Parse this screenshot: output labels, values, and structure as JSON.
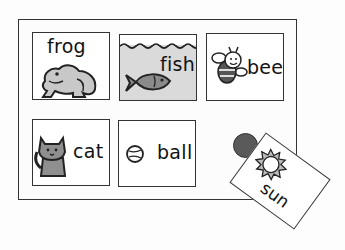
{
  "board": {
    "cards": [
      {
        "id": "frog",
        "label": "frog",
        "icon": "frog-icon",
        "background": "#ffffff"
      },
      {
        "id": "fish",
        "label": "fish",
        "icon": "fish-icon",
        "background": "#dadada"
      },
      {
        "id": "bee",
        "label": "bee",
        "icon": "bee-icon",
        "background": "#ffffff"
      },
      {
        "id": "cat",
        "label": "cat",
        "icon": "cat-icon",
        "background": "#ffffff"
      },
      {
        "id": "ball",
        "label": "ball",
        "icon": "ball-icon",
        "background": "#ffffff"
      }
    ],
    "empty_slot_marker": {
      "shape": "circle",
      "color": "#5a5a5a"
    }
  },
  "dragged_card": {
    "id": "sun",
    "label": "sun",
    "icon": "sun-icon",
    "rotation_deg": 36
  }
}
